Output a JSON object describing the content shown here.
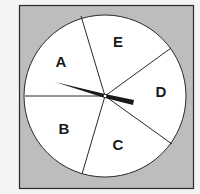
{
  "figure": {
    "type": "spinner",
    "background_color": "#bdbdbd",
    "face_color": "#ffffff",
    "line_color": "#2a2a2a",
    "sectors": [
      {
        "label": "A",
        "x": 61,
        "y": 66
      },
      {
        "label": "E",
        "x": 118,
        "y": 47
      },
      {
        "label": "D",
        "x": 161,
        "y": 97
      },
      {
        "label": "C",
        "x": 120,
        "y": 150
      },
      {
        "label": "B",
        "x": 64,
        "y": 134
      }
    ],
    "pointer": {
      "pointing_toward": "D"
    }
  }
}
